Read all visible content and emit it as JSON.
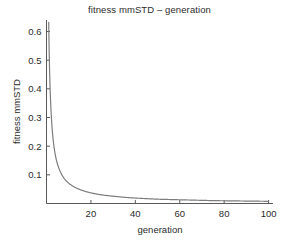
{
  "chart_data": {
    "type": "line",
    "title": "fitness mmSTD – generation",
    "xlabel": "generation",
    "ylabel": "fitness mmSTD",
    "xlim": [
      0,
      102
    ],
    "ylim": [
      0.0,
      0.64
    ],
    "grid": false,
    "legend": null,
    "line_color": "#7d7d7d",
    "axis_color": "#595959",
    "background": "#ffffff",
    "xticks": [
      20,
      40,
      60,
      80,
      100
    ],
    "xtick_labels": [
      "20",
      "40",
      "60",
      "80",
      "100"
    ],
    "yticks": [
      0.1,
      0.2,
      0.3,
      0.4,
      0.5,
      0.6
    ],
    "ytick_labels": [
      "0.1",
      "0.2",
      "0.3",
      "0.4",
      "0.5",
      "0.6"
    ],
    "series": [
      {
        "name": "fitness mmSTD",
        "x": [
          1,
          2,
          3,
          4,
          5,
          6,
          7,
          8,
          9,
          10,
          12,
          14,
          16,
          18,
          20,
          24,
          28,
          32,
          36,
          40,
          45,
          50,
          55,
          60,
          65,
          70,
          75,
          80,
          85,
          90,
          95,
          100
        ],
        "y": [
          0.632,
          0.33,
          0.222,
          0.168,
          0.136,
          0.115,
          0.099,
          0.087,
          0.078,
          0.071,
          0.06,
          0.052,
          0.046,
          0.041,
          0.037,
          0.031,
          0.027,
          0.024,
          0.021,
          0.019,
          0.017,
          0.015,
          0.014,
          0.013,
          0.012,
          0.011,
          0.01,
          0.0095,
          0.009,
          0.0085,
          0.008,
          0.0076
        ]
      }
    ]
  },
  "figure": {
    "title": "fitness mmSTD – generation",
    "xlabel": "generation",
    "ylabel": "fitness mmSTD"
  }
}
